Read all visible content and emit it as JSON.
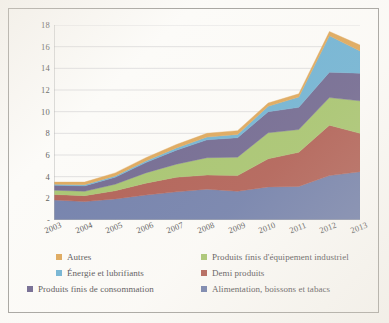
{
  "chart_data": {
    "type": "area",
    "stacked": true,
    "title": "",
    "xlabel": "",
    "ylabel": "",
    "grid": true,
    "legend_position": "bottom",
    "ylim": [
      0,
      18
    ],
    "yticks": [
      "-",
      "2",
      "4",
      "6",
      "8",
      "10",
      "12",
      "14",
      "16",
      "18"
    ],
    "ytick_values": [
      0,
      2,
      4,
      6,
      8,
      10,
      12,
      14,
      16,
      18
    ],
    "categories": [
      "2003",
      "2004",
      "2005",
      "2006",
      "2007",
      "2008",
      "2009",
      "2010",
      "2011",
      "2012",
      "2013"
    ],
    "series": [
      {
        "name": "Alimentation, boissons et tabacs",
        "color": "#4a5c95",
        "values": [
          1.85,
          1.7,
          1.95,
          2.3,
          2.6,
          2.85,
          2.65,
          3.05,
          3.1,
          4.1,
          4.45
        ]
      },
      {
        "name": "Demi produits",
        "color": "#9b3326",
        "values": [
          0.5,
          0.55,
          0.75,
          1.1,
          1.35,
          1.3,
          1.45,
          2.6,
          3.15,
          4.65,
          3.55
        ]
      },
      {
        "name": "Produits finis d'équipement industriel",
        "color": "#8fb548",
        "values": [
          0.4,
          0.4,
          0.6,
          0.95,
          1.2,
          1.6,
          1.7,
          2.4,
          2.1,
          2.55,
          3.0
        ]
      },
      {
        "name": "Produits finis de consommation",
        "color": "#4a3f73",
        "values": [
          0.45,
          0.5,
          0.65,
          0.95,
          1.3,
          1.65,
          1.8,
          1.95,
          2.05,
          2.35,
          2.55
        ]
      },
      {
        "name": "Énergie et lubrifiants",
        "color": "#4a9fc9",
        "values": [
          0.1,
          0.1,
          0.12,
          0.15,
          0.2,
          0.25,
          0.3,
          0.5,
          0.95,
          3.35,
          2.05
        ]
      },
      {
        "name": "Autres",
        "color": "#d6902e",
        "values": [
          0.2,
          0.25,
          0.28,
          0.3,
          0.32,
          0.35,
          0.35,
          0.3,
          0.3,
          0.4,
          0.55
        ]
      }
    ],
    "totals": [
      3.5,
      3.5,
      4.35,
      5.75,
      6.97,
      8.0,
      8.25,
      10.8,
      11.65,
      17.4,
      16.15
    ]
  },
  "legend": {
    "rows": [
      [
        {
          "label": "Autres",
          "color": "#d6902e"
        },
        {
          "label": "Produits finis d'équipement industriel",
          "color": "#8fb548"
        }
      ],
      [
        {
          "label": "Énergie et lubrifiants",
          "color": "#4a9fc9"
        },
        {
          "label": "Demi produits",
          "color": "#9b3326"
        }
      ],
      [
        {
          "label": "Produits finis de consommation",
          "color": "#4a3f73"
        },
        {
          "label": "Alimentation, boissons et tabacs",
          "color": "#4a5c95"
        }
      ]
    ]
  },
  "style": {
    "frame_border": "#8d8b86",
    "grid_color": "#c8c8cc",
    "axis_color": "#9a9a9a",
    "text_color": "#2b2b2b",
    "background": "#fcfbf8"
  }
}
